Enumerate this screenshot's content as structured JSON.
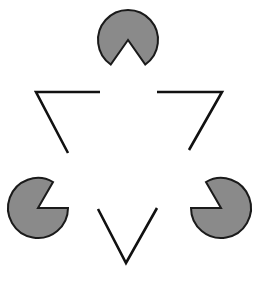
{
  "figure": {
    "title": "Kanizsa triangle illusion",
    "fill_color": "#8a8a8a",
    "stroke_color": "#111111",
    "background": "#ffffff",
    "pacmen": [
      {
        "position": "top",
        "mouth_direction": "down"
      },
      {
        "position": "bottom-left",
        "mouth_direction": "up-right"
      },
      {
        "position": "bottom-right",
        "mouth_direction": "up-left"
      }
    ],
    "line_segments": [
      {
        "position": "upper-left corner"
      },
      {
        "position": "upper-right corner"
      },
      {
        "position": "bottom corner"
      }
    ]
  }
}
